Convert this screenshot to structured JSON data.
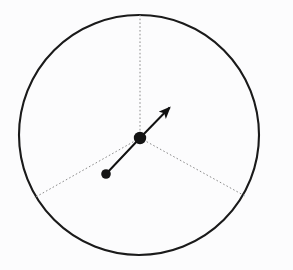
{
  "figure": {
    "background_color": "#fcfcfd",
    "width": 293,
    "height": 270
  },
  "chart_data": {
    "type": "scatter",
    "title": "",
    "xlabel": "",
    "ylabel": "",
    "grid": false,
    "legend": false,
    "xlim": [
      0,
      293
    ],
    "ylim": [
      0,
      270
    ],
    "circle": {
      "name": "boundary-circle",
      "center_x": 139,
      "center_y": 135,
      "radius": 120,
      "stroke_color": "#1a1a1a",
      "stroke_width": 2.1,
      "fill": "none"
    },
    "points": [
      {
        "name": "center-point",
        "label": "center",
        "x": 140,
        "y": 138,
        "radius": 6.2,
        "color": "#141414"
      },
      {
        "name": "satellite-point",
        "label": "point",
        "x": 106,
        "y": 174,
        "radius": 4.8,
        "color": "#141414"
      }
    ],
    "dotted_radii": [
      {
        "name": "radius-up",
        "angle_deg": 90,
        "x1": 140,
        "y1": 138,
        "x2": 140,
        "y2": 15,
        "color": "#8c8c8c",
        "width": 1,
        "dash": "1.6 2.2"
      },
      {
        "name": "radius-lower-left",
        "angle_deg": 210,
        "x1": 140,
        "y1": 138,
        "x2": 34,
        "y2": 198,
        "color": "#8c8c8c",
        "width": 1,
        "dash": "1.6 2.2"
      },
      {
        "name": "radius-lower-right",
        "angle_deg": 330,
        "x1": 140,
        "y1": 138,
        "x2": 245,
        "y2": 196,
        "color": "#8c8c8c",
        "width": 1,
        "dash": "1.6 2.2"
      }
    ],
    "vectors": [
      {
        "name": "arrow-vector",
        "x1": 140,
        "y1": 138,
        "x2": 177,
        "y2": 100,
        "color": "#111111",
        "width": 2.0,
        "arrowhead": true,
        "length": 53.1,
        "angle_deg": 45.8
      },
      {
        "name": "connector-segment",
        "x1": 140,
        "y1": 138,
        "x2": 106,
        "y2": 174,
        "color": "#111111",
        "width": 2.0,
        "arrowhead": false,
        "length": 49.5,
        "angle_deg": 226.6
      }
    ]
  }
}
